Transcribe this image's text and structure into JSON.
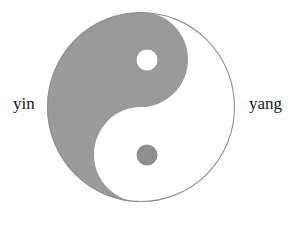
{
  "figure": {
    "name": "yin-yang-taijitu-diagram",
    "background_color": "#ffffff",
    "caption": ""
  },
  "labels": {
    "left": "yin",
    "right": "yang"
  },
  "symbol": {
    "name": "taijitu",
    "outer_circle": {
      "center_x": 141,
      "center_y": 107,
      "diameter": 188,
      "stroke_color": "#8f8f8f",
      "stroke_width": 1
    },
    "dark_half_color": "#9a9a9a",
    "light_half_color": "#ffffff",
    "dots": [
      {
        "name": "light-dot",
        "fill": "#ffffff",
        "center_x": 147,
        "center_y": 60,
        "diameter": 21
      },
      {
        "name": "dark-dot",
        "fill": "#8e8e8e",
        "center_x": 147,
        "center_y": 155,
        "diameter": 21
      }
    ]
  }
}
